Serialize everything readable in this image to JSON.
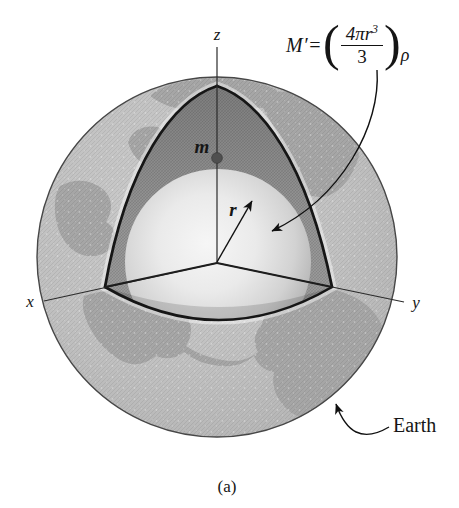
{
  "figure": {
    "caption": "(a)",
    "axes": {
      "x_label": "x",
      "y_label": "y",
      "z_label": "z"
    },
    "mass_point_label": "m",
    "radius_label": "r",
    "earth_label": "Earth",
    "formula": {
      "lhs": "M′=",
      "open_paren": "(",
      "numerator_base": "4πr",
      "numerator_exponent": "3",
      "denominator": "3",
      "close_paren": ")",
      "subscript": "ρ"
    },
    "colors": {
      "background": "#ffffff",
      "sphere_base": "#c2c2c2",
      "continent": "#a6a6a6",
      "cut_face": "#9c9c9c",
      "inner_sphere_highlight": "#f5f5f5",
      "outline": "#1a1a1a"
    }
  }
}
